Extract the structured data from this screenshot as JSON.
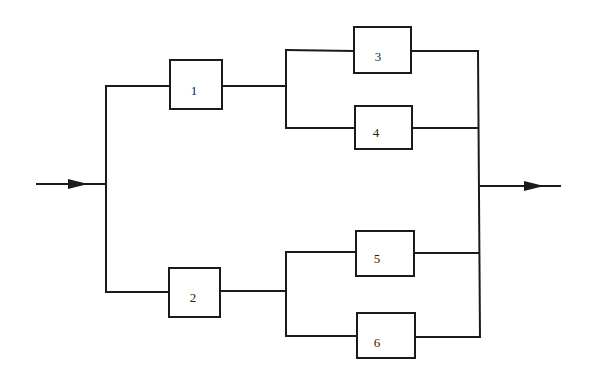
{
  "diagram": {
    "type": "reliability-block-diagram",
    "colors": {
      "line": "#1a1a1a",
      "background": "#ffffff"
    },
    "input": {
      "label": ""
    },
    "output": {
      "label": ""
    },
    "blocks": [
      {
        "id": "1",
        "label": "1",
        "x": 170,
        "y": 60,
        "w": 52,
        "h": 49
      },
      {
        "id": "2",
        "label": "2",
        "x": 169,
        "y": 268,
        "w": 51,
        "h": 49
      },
      {
        "id": "3",
        "label": "3",
        "x": 354,
        "y": 27,
        "w": 57,
        "h": 46
      },
      {
        "id": "4",
        "label": "4",
        "x": 355,
        "y": 106,
        "w": 57,
        "h": 43
      },
      {
        "id": "5",
        "label": "5",
        "x": 356,
        "y": 231,
        "w": 58,
        "h": 45
      },
      {
        "id": "6",
        "label": "6",
        "x": 357,
        "y": 313,
        "w": 58,
        "h": 45
      }
    ],
    "connections": [
      [
        "input",
        "1"
      ],
      [
        "input",
        "2"
      ],
      [
        "1",
        "3"
      ],
      [
        "1",
        "4"
      ],
      [
        "2",
        "5"
      ],
      [
        "2",
        "6"
      ],
      [
        "3",
        "output"
      ],
      [
        "4",
        "output"
      ],
      [
        "5",
        "output"
      ],
      [
        "6",
        "output"
      ]
    ]
  }
}
